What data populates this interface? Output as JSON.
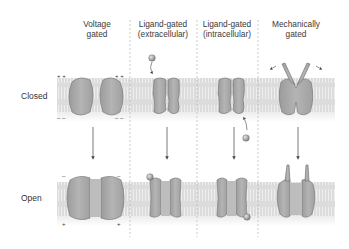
{
  "columns": [
    {
      "id": "voltage",
      "line1": "Voltage",
      "line2": "gated",
      "center_x": 97
    },
    {
      "id": "ligand-extra",
      "line1": "Ligand-gated",
      "line2": "(extracellular)",
      "center_x": 163
    },
    {
      "id": "ligand-intra",
      "line1": "Ligand-gated",
      "line2": "(intracellular)",
      "center_x": 227
    },
    {
      "id": "mechanical",
      "line1": "Mechanically",
      "line2": "gated",
      "center_x": 296
    }
  ],
  "rows": {
    "closed": "Closed",
    "open": "Open"
  },
  "charges": {
    "plus": "+ +",
    "minus": "– –",
    "single_plus": "+",
    "single_minus": "–"
  },
  "colors": {
    "membrane": "#d9d9d9",
    "lipid_lines": "#ffffff",
    "protein_fill": "#a8a8a8",
    "protein_stroke": "#7a7a7a",
    "ligand": "#9a9a9a",
    "divider": "#b0b0b0",
    "arrow": "#444444",
    "text": "#333333"
  }
}
